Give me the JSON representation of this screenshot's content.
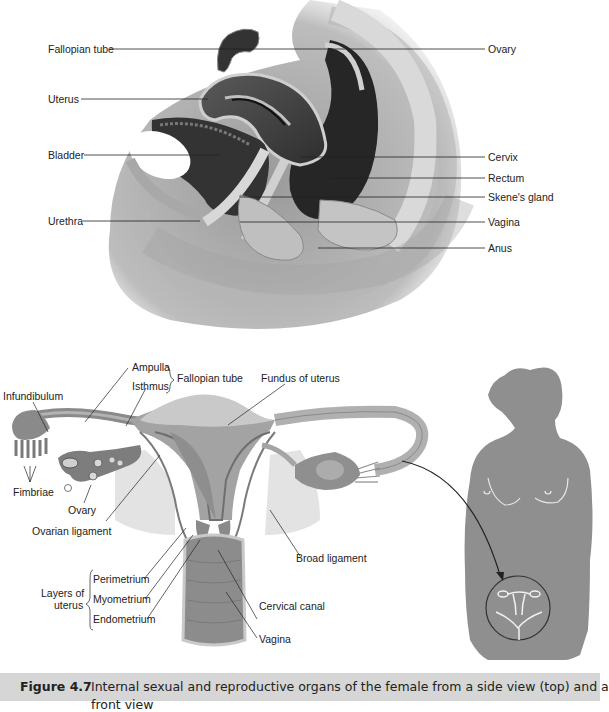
{
  "figure": {
    "number": "Figure 4.7",
    "caption_line1": "Internal sexual and reproductive organs of the female from a side view (top) and a",
    "caption_line2": "front view"
  },
  "side_view": {
    "left_labels": [
      "Fallopian tube",
      "Uterus",
      "Bladder",
      "Urethra"
    ],
    "right_labels": [
      "Ovary",
      "Cervix",
      "Rectum",
      "Skene's gland",
      "Vagina",
      "Anus"
    ]
  },
  "front_view": {
    "labels": {
      "ampulla": "Ampulla",
      "isthmus": "Isthmus",
      "fallopian_tube": "Fallopian tube",
      "fundus": "Fundus of uterus",
      "infundibulum": "Infundibulum",
      "fimbriae": "Fimbriae",
      "ovary": "Ovary",
      "ovarian_ligament": "Ovarian ligament",
      "broad_ligament": "Broad ligament",
      "layers_of_uterus_1": "Layers of",
      "layers_of_uterus_2": "uterus",
      "perimetrium": "Perimetrium",
      "myometrium": "Myometrium",
      "endometrium": "Endometrium",
      "cervical_canal": "Cervical canal",
      "vagina": "Vagina"
    }
  },
  "colors": {
    "caption_bg": "#d6d6d6",
    "silhouette": "#8f8f8f",
    "tissue_dark": "#3a3a3a",
    "tissue_mid": "#8a8a8a",
    "tissue_light": "#c8c8c8"
  }
}
